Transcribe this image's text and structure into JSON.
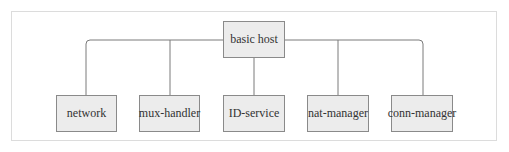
{
  "diagram": {
    "root": {
      "label": "basic host"
    },
    "children": [
      {
        "label": "network"
      },
      {
        "label": "mux-handler"
      },
      {
        "label": "ID-service"
      },
      {
        "label": "nat-manager"
      },
      {
        "label": "conn-manager"
      }
    ],
    "colors": {
      "box_fill": "#ececec",
      "box_border": "#8a8a8a",
      "line": "#7a7a7a",
      "frame": "#dcdcdc"
    }
  }
}
